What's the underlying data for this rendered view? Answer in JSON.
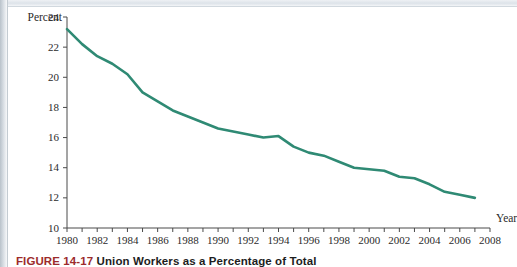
{
  "figure": {
    "label": "FIGURE 14-17",
    "title": "Union Workers as a Percentage of Total"
  },
  "chart_data": {
    "type": "line",
    "title": "",
    "xlabel": "Year",
    "ylabel": "Percent",
    "xlim": [
      1980,
      2008
    ],
    "ylim": [
      10,
      24
    ],
    "ytick_step": 2,
    "xtick_step": 1,
    "xtick_label_step": 2,
    "grid": false,
    "legend": false,
    "line_color": "#2f8a74",
    "x_tick_labels": [
      "1980",
      "1982",
      "1984",
      "1986",
      "1988",
      "1990",
      "1992",
      "1994",
      "1996",
      "1998",
      "2000",
      "2002",
      "2004",
      "2006",
      "2008"
    ],
    "y_tick_labels": [
      "10",
      "12",
      "14",
      "16",
      "18",
      "20",
      "22",
      "24"
    ],
    "x": [
      1980,
      1981,
      1982,
      1983,
      1984,
      1985,
      1986,
      1987,
      1988,
      1989,
      1990,
      1991,
      1992,
      1993,
      1994,
      1995,
      1996,
      1997,
      1998,
      1999,
      2000,
      2001,
      2002,
      2003,
      2004,
      2005,
      2006,
      2007
    ],
    "values": [
      23.2,
      22.2,
      21.4,
      20.9,
      20.2,
      19.0,
      18.4,
      17.8,
      17.4,
      17.0,
      16.6,
      16.4,
      16.2,
      16.0,
      16.1,
      15.4,
      15.0,
      14.8,
      14.4,
      14.0,
      13.9,
      13.8,
      13.4,
      13.3,
      12.9,
      12.4,
      12.2,
      12.0
    ]
  }
}
